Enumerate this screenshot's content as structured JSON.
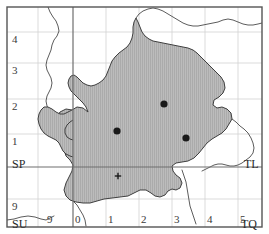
{
  "figure": {
    "name": "national-grid-map",
    "frame": {
      "x": 7,
      "y": 7,
      "width": 255,
      "height": 220
    },
    "colors": {
      "region_fill": "#b9b9b9",
      "region_hatch": "#a3a3a3",
      "region_outline": "#3f3f3f",
      "grid_minor": "#cfcfcf",
      "grid_major": "#6e6e6e",
      "frame": "#555555",
      "coastline": "#4a4a4a",
      "marker": "#1a1a1a",
      "label_text": "#2b2b2b"
    }
  },
  "grid": {
    "major_vertical_x": 73,
    "major_horizontal_y": 167,
    "minor_vertical_x": [
      38,
      106,
      139,
      172,
      205,
      238
    ],
    "minor_horizontal_y": [
      32,
      63,
      99,
      134,
      199
    ],
    "cell_px": 33
  },
  "axes": {
    "x_ticks": [
      {
        "label": "0",
        "x": 73
      },
      {
        "label": "1",
        "x": 106
      },
      {
        "label": "2",
        "x": 139
      },
      {
        "label": "3",
        "x": 172
      },
      {
        "label": "4",
        "x": 205
      },
      {
        "label": "5",
        "x": 238
      }
    ],
    "x_ticks_left": [
      {
        "label": "9",
        "x": 47
      }
    ],
    "y_ticks": [
      {
        "label": "4",
        "y": 32
      },
      {
        "label": "3",
        "y": 63
      },
      {
        "label": "2",
        "y": 99
      },
      {
        "label": "1",
        "y": 134
      },
      {
        "label": "9",
        "y": 199
      }
    ]
  },
  "square_labels": [
    {
      "name": "square-label-sp",
      "text": "SP",
      "x": 12,
      "y": 158
    },
    {
      "name": "square-label-tl",
      "text": "TL",
      "x": 244,
      "y": 158
    },
    {
      "name": "square-label-su",
      "text": "SU",
      "x": 12,
      "y": 218
    },
    {
      "name": "square-label-tq",
      "text": "TQ",
      "x": 241,
      "y": 218
    }
  ],
  "markers": [
    {
      "name": "site-marker-1",
      "x": 117,
      "y": 131,
      "r": 3.6,
      "kind": "dot"
    },
    {
      "name": "site-marker-2",
      "x": 164,
      "y": 104,
      "r": 3.6,
      "kind": "dot"
    },
    {
      "name": "site-marker-3",
      "x": 186,
      "y": 138,
      "r": 3.6,
      "kind": "dot"
    },
    {
      "name": "site-marker-4",
      "x": 118,
      "y": 176,
      "r": 1.8,
      "kind": "cross"
    }
  ],
  "region": {
    "name": "shaded-study-area",
    "path": "M 88,112 L 83,108 L 77,107 L 72,110 L 66,109 L 60,112 L 56,118 L 55,124 L 57,131 L 60,137 L 63,143 L 64,150 L 66,156 L 70,160 L 73,165 L 72,171 L 69,177 L 66,183 L 64,190 L 66,196 L 70,200 L 76,202 L 83,203 L 90,203 L 97,201 L 104,199 L 112,198 L 120,197 L 128,196 L 134,193 L 140,190 L 146,190 L 151,193 L 155,196 L 160,197 L 165,195 L 168,191 L 172,189 L 176,190 L 180,188 L 182,183 L 180,178 L 176,175 L 173,171 L 172,166 L 176,163 L 182,162 L 188,161 L 194,158 L 199,153 L 203,148 L 207,143 L 212,139 L 217,136 L 222,133 L 226,129 L 229,124 L 232,119 L 231,113 L 227,109 L 222,107 L 217,108 L 213,105 L 214,100 L 219,97 L 223,93 L 225,88 L 224,82 L 221,77 L 217,73 L 213,69 L 209,65 L 205,61 L 201,57 L 197,53 L 193,50 L 188,48 L 183,47 L 178,46 L 173,45 L 168,44 L 163,43 L 158,42 L 153,41 L 149,39 L 145,36 L 142,32 L 140,27 L 138,22 L 136,18 L 134,22 L 133,27 L 133,33 L 132,38 L 130,43 L 127,47 L 123,50 L 119,53 L 115,57 L 112,61 L 110,66 L 108,71 L 106,76 L 103,80 L 99,83 L 95,85 L 91,86 L 87,85 L 83,83 L 80,80 L 77,77 L 74,75 L 71,76 L 69,79 L 68,83 L 69,87 L 71,91 L 74,94 L 77,97 L 80,100 L 83,103 L 86,107 Z",
    "inner_paths": [
      "M 72,110 L 68,112 L 64,114 L 60,114 L 56,112 L 52,109 L 48,107 L 44,107 L 41,110 L 39,114 L 38,119 L 39,124 L 41,129 L 44,133 L 48,136 L 52,138 L 56,140 L 59,143 L 61,147 L 63,151 L 66,154 L 70,156 L 73,157",
      "M 73,120 L 70,122 L 67,125 L 65,129 L 65,133 L 67,137 L 70,139 L 73,140"
    ]
  },
  "coastlines": [
    {
      "name": "coastline-west",
      "path": "M 48,7 L 50,12 L 53,17 L 56,21 L 58,26 L 59,31 L 57,36 L 54,40 L 52,45 L 51,50 L 49,55 L 47,60 L 46,65 L 47,70 L 49,74 L 51,78 L 52,83 L 51,88 L 49,92 L 47,96 L 46,101 L 47,106 L 49,110 L 52,113"
    },
    {
      "name": "coastline-north",
      "path": "M 136,18 L 139,14 L 143,11 L 148,9 L 153,8 L 158,9 L 163,11 L 168,14 L 173,17 L 178,20 L 183,23 L 188,25 L 193,26 L 198,26 L 203,25 L 208,24 L 213,23 L 218,22 L 223,20 L 228,19 L 233,20 L 238,22 L 243,24 L 248,25 L 253,25 L 258,24 L 262,23"
    },
    {
      "name": "coastline-east",
      "path": "M 232,119 L 236,122 L 240,126 L 244,129 L 248,133 L 251,138 L 253,143 L 254,148 L 253,153 L 250,157 L 246,160 L 242,163 L 238,165 L 234,166 L 230,166 L 226,165 L 222,164 L 218,164 L 214,165 L 210,167 L 206,169 L 202,171"
    },
    {
      "name": "river-south",
      "path": "M 182,170 L 184,176 L 186,182 L 187,188 L 188,194 L 189,200 L 190,206 L 192,212 L 194,218 L 196,224"
    },
    {
      "name": "river-southwest",
      "path": "M 73,201 L 77,205 L 80,210 L 83,215 L 85,220 L 86,226"
    },
    {
      "name": "coastline-southwest-spur",
      "path": "M 7,220 L 14,219 L 21,217 L 28,216 L 35,217 L 41,219 L 46,220 L 50,218 L 54,216"
    },
    {
      "name": "coastline-inlet",
      "path": "M 52,113 L 56,116 L 60,118 L 64,119 L 68,119"
    }
  ]
}
